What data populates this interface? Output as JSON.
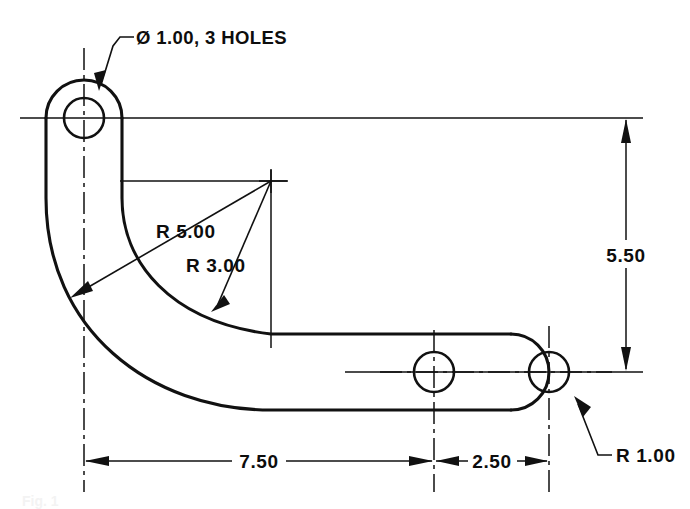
{
  "drawing": {
    "type": "mechanical-part-orthographic-view",
    "units": "inches",
    "line_color": "#111111",
    "background": "#ffffff",
    "notes": [
      {
        "name": "hole-callout",
        "text": "Ø 1.00, 3 HOLES",
        "x": 136,
        "y": 44
      }
    ],
    "dimensions": [
      {
        "name": "overall-height",
        "label": "5.50",
        "orientation": "vertical",
        "x": 626,
        "from_y": 118,
        "to_y": 371,
        "text_x": 626,
        "text_y": 256
      },
      {
        "name": "length-to-middle-hole",
        "label": "7.50",
        "orientation": "horizontal",
        "y": 461,
        "from_x": 84,
        "to_x": 434,
        "text_x": 258,
        "text_y": 468
      },
      {
        "name": "hole-spacing",
        "label": "2.50",
        "orientation": "horizontal",
        "y": 461,
        "from_x": 434,
        "to_x": 549,
        "text_x": 492,
        "text_y": 468
      }
    ],
    "radii": [
      {
        "name": "radius-r5",
        "label": "R 5.00",
        "value": 5.0,
        "text_x": 156,
        "text_y": 238,
        "center_x": 271,
        "center_y": 181,
        "arrow_x": 72,
        "arrow_y": 297
      },
      {
        "name": "radius-r3",
        "label": "R 3.00",
        "value": 3.0,
        "text_x": 186,
        "text_y": 272,
        "center_x": 271,
        "center_y": 181,
        "arrow_x": 211,
        "arrow_y": 310
      },
      {
        "name": "radius-r1",
        "label": "R 1.00",
        "value": 1.0,
        "text_x": 616,
        "text_y": 462,
        "arrow_x": 575,
        "arrow_y": 398
      }
    ],
    "holes": [
      {
        "name": "hole-top",
        "cx": 84,
        "cy": 118,
        "r": 20,
        "boss_r": 38,
        "diameter": 1.0
      },
      {
        "name": "hole-middle",
        "cx": 434,
        "cy": 372,
        "r": 20,
        "boss_r": 38,
        "diameter": 1.0
      },
      {
        "name": "hole-right",
        "cx": 549,
        "cy": 372,
        "r": 20,
        "boss_r": 38,
        "diameter": 1.0
      }
    ],
    "radius_center_mark": {
      "name": "radius-center-mark",
      "x": 271,
      "y": 181
    },
    "caption": {
      "name": "figure-caption",
      "text": "Fig. 1"
    }
  }
}
